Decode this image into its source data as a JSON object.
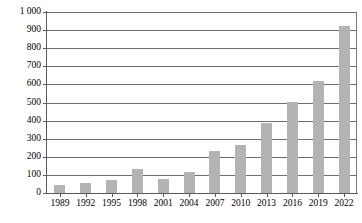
{
  "chart_data": {
    "type": "bar",
    "title": "",
    "subtitle": "",
    "xlabel": "",
    "ylabel": "",
    "categories": [
      "1989",
      "1992",
      "1995",
      "1998",
      "2001",
      "2004",
      "2007",
      "2010",
      "2013",
      "2016",
      "2019",
      "2022"
    ],
    "values": [
      45,
      55,
      72,
      130,
      80,
      118,
      232,
      265,
      385,
      505,
      620,
      920
    ],
    "series": [
      {
        "name": "",
        "values": [
          45,
          55,
          72,
          130,
          80,
          118,
          232,
          265,
          385,
          505,
          620,
          920
        ]
      }
    ],
    "ylim": [
      0,
      1000
    ],
    "ytick_values": [
      0,
      100,
      200,
      300,
      400,
      500,
      600,
      700,
      800,
      900,
      1000
    ],
    "ytick_labels": [
      "0",
      "100",
      "200",
      "300",
      "400",
      "500",
      "600",
      "700",
      "800",
      "900",
      "1 000"
    ],
    "xtick_labels": [
      "1989",
      "1992",
      "1995",
      "1998",
      "2001",
      "2004",
      "2007",
      "2010",
      "2013",
      "2016",
      "2019",
      "2022"
    ],
    "grid": true,
    "grid_axis": "y",
    "legend": false,
    "legend_position": "none",
    "bar_color": "#b3b3b3",
    "axis_color": "#5a5a5a",
    "gridline_color": "#6f6f6f",
    "background_color": "#ffffff",
    "annotations": []
  }
}
